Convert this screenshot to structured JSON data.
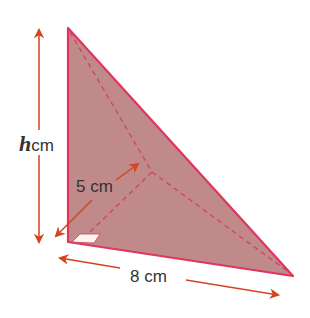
{
  "diagram": {
    "type": "triangular-based pyramid",
    "colors": {
      "face_fill": "#c08a8a",
      "edge": "#e0355f",
      "arrow": "#d2451e",
      "right_angle_marker": "#fff4ec"
    },
    "labels": {
      "height_var": "h",
      "height_unit": "cm",
      "depth": "5 cm",
      "base": "8 cm"
    }
  }
}
